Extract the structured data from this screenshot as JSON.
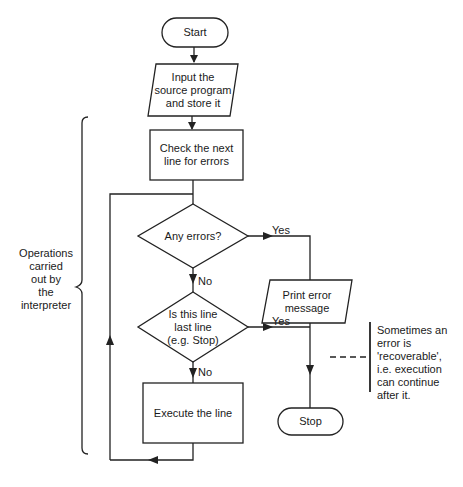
{
  "diagram": {
    "type": "flowchart",
    "line_color": "#222222",
    "nodes": {
      "start": {
        "shape": "terminator",
        "label": "Start"
      },
      "input": {
        "shape": "parallelogram",
        "label": "Input the\nsource program\nand store it"
      },
      "check": {
        "shape": "process",
        "label": "Check the next\nline for errors"
      },
      "any_errors": {
        "shape": "decision",
        "label": "Any errors?"
      },
      "print_error": {
        "shape": "parallelogram",
        "label": "Print error\nmessage"
      },
      "last_line": {
        "shape": "decision",
        "label": "Is this line\nlast line\n(e.g. Stop)"
      },
      "execute": {
        "shape": "process",
        "label": "Execute the line"
      },
      "stop": {
        "shape": "terminator",
        "label": "Stop"
      }
    },
    "edges": {
      "any_errors_yes": "Yes",
      "any_errors_no": "No",
      "last_line_yes": "Yes",
      "last_line_no": "No"
    },
    "brace_label": "Operations\ncarried\nout by\nthe\ninterpreter",
    "note": "Sometimes an\nerror is\n'recoverable',\ni.e. execution\ncan continue\nafter it."
  }
}
